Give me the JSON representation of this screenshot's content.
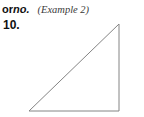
{
  "page": {
    "background_color": "#ffffff",
    "width": 144,
    "height": 117
  },
  "header": {
    "prefix_text": "or",
    "emphasis_text": "no.",
    "reference_text": "(Example 2)"
  },
  "problem": {
    "number_label": "10."
  },
  "figure": {
    "name": "right-triangle",
    "stroke_color": "#848484",
    "fill_color": "none",
    "stroke_width": 1,
    "right_angle_position": "bottom-right",
    "vertices": [
      {
        "name": "bottom-left",
        "x": 29,
        "y": 111
      },
      {
        "name": "top-right",
        "x": 119,
        "y": 24
      },
      {
        "name": "bottom-right",
        "x": 119,
        "y": 111
      }
    ],
    "points_attr": "29,111 119,24 119,111"
  }
}
